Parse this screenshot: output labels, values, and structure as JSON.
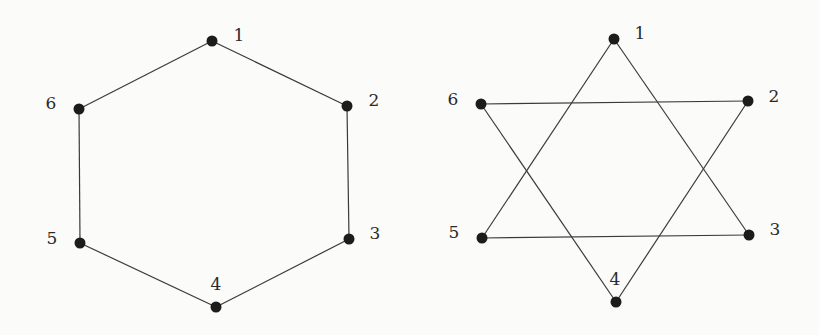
{
  "figure": {
    "background": "#fbfbfa",
    "node_color": "#1c1c1c",
    "edge_color": "#3a3a3a",
    "node_radius": 5.5
  },
  "graphs": [
    {
      "name": "hexagon-cycle",
      "description": "6-cycle C6: 1-2-3-4-5-6-1",
      "nodes": [
        {
          "id": "1",
          "x": 212,
          "y": 41,
          "label": "1",
          "lx": 239,
          "ly": 36
        },
        {
          "id": "2",
          "x": 347,
          "y": 106,
          "label": "2",
          "lx": 374,
          "ly": 101
        },
        {
          "id": "3",
          "x": 349,
          "y": 239,
          "label": "3",
          "lx": 375,
          "ly": 234
        },
        {
          "id": "4",
          "x": 216,
          "y": 307,
          "label": "4",
          "lx": 216,
          "ly": 285
        },
        {
          "id": "5",
          "x": 80,
          "y": 243,
          "label": "5",
          "lx": 52,
          "ly": 239
        },
        {
          "id": "6",
          "x": 79,
          "y": 109,
          "label": "6",
          "lx": 51,
          "ly": 104
        }
      ],
      "edges": [
        [
          "1",
          "2"
        ],
        [
          "2",
          "3"
        ],
        [
          "3",
          "4"
        ],
        [
          "4",
          "5"
        ],
        [
          "5",
          "6"
        ],
        [
          "6",
          "1"
        ]
      ]
    },
    {
      "name": "two-triangles-star",
      "description": "Two disjoint triangles {1,3,5} and {2,4,6} forming a hexagram",
      "nodes": [
        {
          "id": "1",
          "x": 614,
          "y": 39,
          "label": "1",
          "lx": 640,
          "ly": 34
        },
        {
          "id": "2",
          "x": 748,
          "y": 101,
          "label": "2",
          "lx": 774,
          "ly": 97
        },
        {
          "id": "3",
          "x": 749,
          "y": 235,
          "label": "3",
          "lx": 775,
          "ly": 230
        },
        {
          "id": "4",
          "x": 616,
          "y": 302,
          "label": "4",
          "lx": 615,
          "ly": 280
        },
        {
          "id": "5",
          "x": 482,
          "y": 238,
          "label": "5",
          "lx": 454,
          "ly": 233
        },
        {
          "id": "6",
          "x": 481,
          "y": 104,
          "label": "6",
          "lx": 453,
          "ly": 100
        }
      ],
      "edges": [
        [
          "1",
          "3"
        ],
        [
          "3",
          "5"
        ],
        [
          "5",
          "1"
        ],
        [
          "2",
          "4"
        ],
        [
          "4",
          "6"
        ],
        [
          "6",
          "2"
        ]
      ]
    }
  ]
}
